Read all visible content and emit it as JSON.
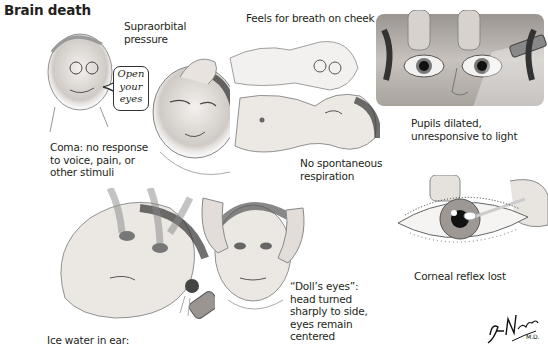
{
  "title": "Brain death",
  "top_cut_text": "...",
  "panels": {
    "coma": {
      "label_top": [
        "Supraorbital",
        "pressure"
      ],
      "speech": [
        "Open",
        "your",
        "eyes"
      ],
      "caption": [
        "Coma: no response",
        "to voice, pain, or",
        "other stimuli"
      ]
    },
    "respiration": {
      "label_top": "Feels for breath on cheek",
      "caption": [
        "No spontaneous",
        "respiration"
      ]
    },
    "pupils": {
      "caption": [
        "Pupils dilated,",
        "unresponsive to light"
      ]
    },
    "corneal": {
      "caption": "Corneal reflex lost"
    },
    "ice_water": {
      "caption": "Ice water in ear:"
    },
    "dolls_eyes": {
      "caption": [
        "“Doll’s eyes”:",
        "head turned",
        "sharply to side,",
        "eyes remain",
        "centered"
      ]
    }
  },
  "signature": "F. Netter M.D.",
  "colors": {
    "ink": "#231f20",
    "shade": "#8a8a8a",
    "skin": "#e9e4df",
    "bg": "#ffffff"
  }
}
